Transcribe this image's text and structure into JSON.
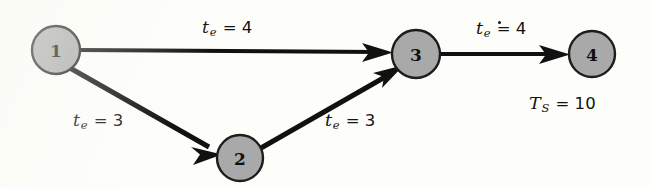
{
  "diagram": {
    "background_color": "#fdfdfa",
    "node_fill_color": "#a9a9a9",
    "node_stroke_color": "#1c1c1c",
    "edge_color": "#111111",
    "nodes": [
      {
        "id": "1",
        "label": "1",
        "cx": 56,
        "cy": 50,
        "r": 24
      },
      {
        "id": "2",
        "label": "2",
        "cx": 240,
        "cy": 158,
        "r": 23
      },
      {
        "id": "3",
        "label": "3",
        "cx": 416,
        "cy": 54,
        "r": 24
      },
      {
        "id": "4",
        "label": "4",
        "cx": 592,
        "cy": 54,
        "r": 23
      }
    ],
    "edges": [
      {
        "from": "1",
        "to": "3",
        "label_var": "t",
        "label_sub": "e",
        "label_value": "4",
        "prime": false
      },
      {
        "from": "1",
        "to": "2",
        "label_var": "t",
        "label_sub": "e",
        "label_value": "3",
        "prime": false
      },
      {
        "from": "2",
        "to": "3",
        "label_var": "t",
        "label_sub": "e",
        "label_value": "3",
        "prime": false
      },
      {
        "from": "3",
        "to": "4",
        "label_var": "t",
        "label_sub": "e",
        "label_value": "4",
        "prime": true
      }
    ],
    "annotation": {
      "var": "T",
      "sub": "S",
      "equals": "=",
      "value": "10"
    },
    "equals_symbol": "="
  }
}
